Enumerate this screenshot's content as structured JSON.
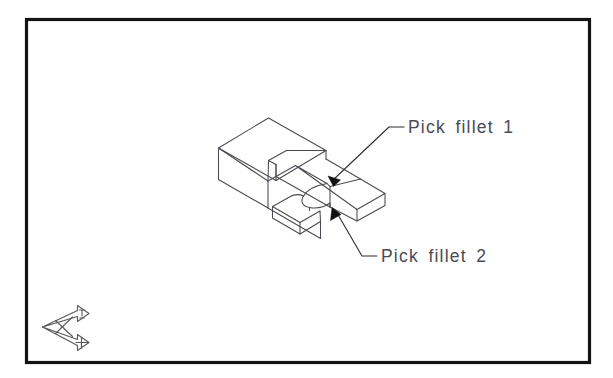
{
  "viewport": {
    "name": "cad-drawing-viewport",
    "background_color": "#ffffff",
    "border_color": "#131313",
    "width": 613,
    "height": 378
  },
  "annotations": [
    {
      "id": "fillet-1",
      "text": "Pick fillet 1",
      "text_color": "#4b4b53",
      "leader": {
        "arrow_tip_x": 328,
        "arrow_tip_y": 176,
        "elbow_x": 389,
        "elbow_y": 127,
        "landing_end_x": 404,
        "landing_end_y": 127
      }
    },
    {
      "id": "fillet-2",
      "text": "Pick fillet 2",
      "text_color": "#4b4b53",
      "leader": {
        "arrow_tip_x": 332,
        "arrow_tip_y": 209,
        "elbow_x": 362,
        "elbow_y": 256,
        "landing_end_x": 377,
        "landing_end_y": 256
      }
    }
  ],
  "ucs_icon": {
    "name": "ucs-isometric-icon",
    "x_axis_label": "X",
    "y_axis_label": "Y",
    "stroke_color": "#5a5a62"
  },
  "model": {
    "name": "filleted-fork-solid",
    "description": "Isometric 3D solid: rectangular block with tapered sloping body terminating in a two-prong fork separated by a filleted U-slot",
    "edge_color": "#4a4a52",
    "projection": "isometric"
  }
}
